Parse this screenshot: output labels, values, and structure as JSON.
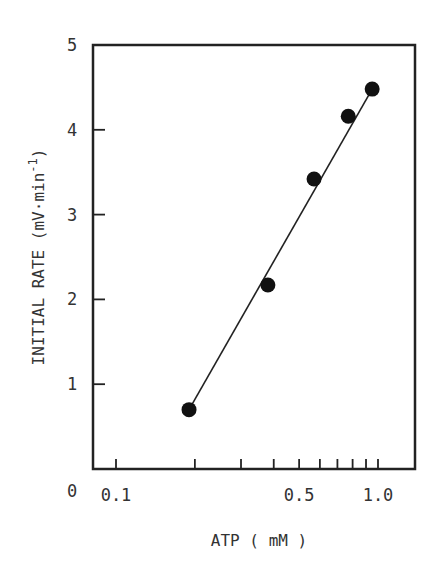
{
  "chart_data": {
    "type": "scatter",
    "title": "",
    "xlabel": "ATP ( mM )",
    "ylabel": "INITIAL RATE (mV·min⁻¹)",
    "ylabel_main": "INITIAL RATE (mV·min",
    "ylabel_sup": "-1",
    "ylabel_close": ")",
    "xscale": "log",
    "xlim": [
      0.08,
      1.38
    ],
    "ylim": [
      0,
      5
    ],
    "x_tick_labels": [
      "0.1",
      "0.5",
      "1.0"
    ],
    "x_tick_values": [
      0.1,
      0.2,
      0.3,
      0.4,
      0.5,
      0.6,
      0.7,
      0.8,
      0.9,
      1.0
    ],
    "y_tick_labels": [
      "0",
      "1",
      "2",
      "3",
      "4",
      "5"
    ],
    "y_tick_values": [
      0,
      1,
      2,
      3,
      4,
      5
    ],
    "grid": false,
    "legend": null,
    "series": [
      {
        "name": "measured",
        "marker": "filled-circle",
        "x": [
          0.19,
          0.38,
          0.57,
          0.77,
          0.95
        ],
        "y": [
          0.7,
          2.17,
          3.42,
          4.16,
          4.48
        ]
      },
      {
        "name": "fit",
        "type": "line",
        "x": [
          0.19,
          0.95
        ],
        "y": [
          0.7,
          4.48
        ]
      }
    ]
  }
}
